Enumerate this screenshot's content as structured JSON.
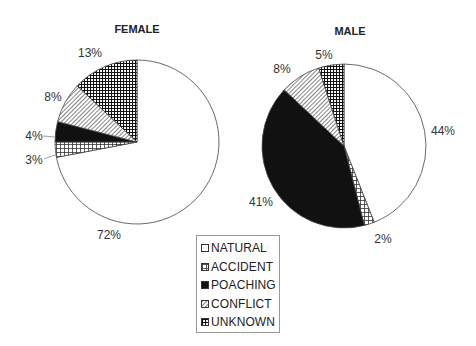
{
  "chart_data": [
    {
      "type": "pie",
      "title": "FEMALE",
      "categories": [
        "NATURAL",
        "ACCIDENT",
        "POACHING",
        "CONFLICT",
        "UNKNOWN"
      ],
      "values": [
        72,
        3,
        4,
        8,
        13
      ],
      "labels": [
        "72%",
        "3%",
        "4%",
        "8%",
        "13%"
      ],
      "start_angle": "12 o'clock, clockwise"
    },
    {
      "type": "pie",
      "title": "MALE",
      "categories": [
        "NATURAL",
        "ACCIDENT",
        "POACHING",
        "CONFLICT",
        "UNKNOWN"
      ],
      "values": [
        44,
        2,
        41,
        8,
        5
      ],
      "labels": [
        "44%",
        "2%",
        "41%",
        "8%",
        "5%"
      ],
      "start_angle": "12 o'clock, clockwise"
    }
  ],
  "legend": {
    "position": "bottom-center",
    "items": [
      {
        "label": "NATURAL",
        "pattern": "white"
      },
      {
        "label": "ACCIDENT",
        "pattern": "grid"
      },
      {
        "label": "POACHING",
        "pattern": "black"
      },
      {
        "label": "CONFLICT",
        "pattern": "diagonal"
      },
      {
        "label": "UNKNOWN",
        "pattern": "dense-grid"
      }
    ]
  },
  "titles": {
    "female": "FEMALE",
    "male": "MALE"
  },
  "labels": {
    "female": {
      "natural": "72%",
      "accident": "3%",
      "poaching": "4%",
      "conflict": "8%",
      "unknown": "13%"
    },
    "male": {
      "natural": "44%",
      "accident": "2%",
      "poaching": "41%",
      "conflict": "8%",
      "unknown": "5%"
    }
  }
}
